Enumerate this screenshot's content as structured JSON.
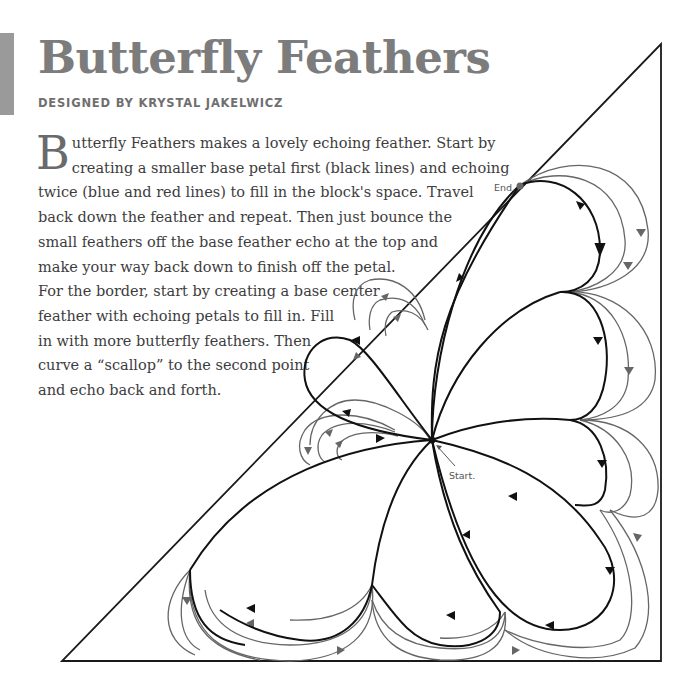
{
  "header": {
    "title": "Butterfly Feathers",
    "byline": "DESIGNED BY KRYSTAL JAKELWICZ"
  },
  "body": {
    "drop_cap": "B",
    "lines": [
      "utterfly Feathers makes a lovely echoing feather. Start by",
      "creating a smaller base petal first (black lines) and echoing",
      "twice (blue and red lines) to fill in the block's space. Travel",
      "back down the feather and repeat. Then just bounce the",
      "small feathers off the base feather echo at the top and",
      "make your way back down to finish off the petal.",
      "For the border, start by creating a base center",
      "feather with echoing petals to fill in. Fill",
      "in with more butterfly feathers. Then",
      "curve a “scallop” to the second point",
      "and echo back and forth."
    ]
  },
  "diagram": {
    "labels": {
      "end": "End.",
      "start": "Start."
    },
    "colors": {
      "base_line": "#111111",
      "echo_line": "#666666",
      "frame": "#1a1a1a",
      "side_bar": "#9a9a9a"
    }
  }
}
